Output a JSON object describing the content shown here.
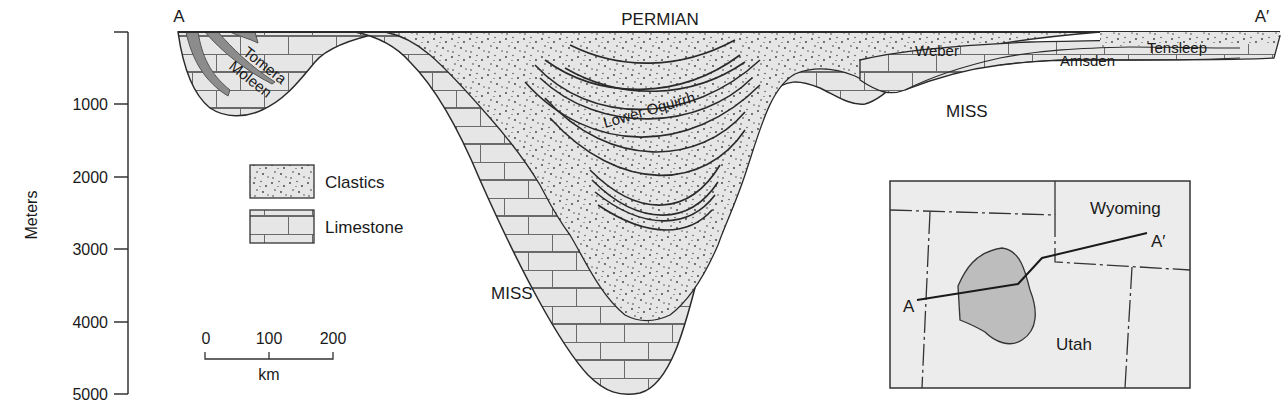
{
  "section_ends": {
    "left": "A",
    "right": "A′"
  },
  "y_axis": {
    "label": "Meters",
    "ticks": [
      {
        "value": "1000",
        "y": 104
      },
      {
        "value": "2000",
        "y": 177
      },
      {
        "value": "3000",
        "y": 249
      },
      {
        "value": "4000",
        "y": 322
      },
      {
        "value": "5000",
        "y": 394
      }
    ]
  },
  "formations": {
    "permian": "PERMIAN",
    "tomera": "Tomera",
    "moleen": "Moleen",
    "lower_oquirrh": "Lower Oquirrh",
    "weber": "Weber",
    "amsden": "Amsden",
    "tensleep": "Tensleep",
    "miss_left": "MISS",
    "miss_right": "MISS"
  },
  "legend": {
    "items": [
      {
        "label": "Clastics",
        "pattern": "dots"
      },
      {
        "label": "Limestone",
        "pattern": "bricks"
      }
    ]
  },
  "scale_bar": {
    "ticks": [
      "0",
      "100",
      "200"
    ],
    "unit": "km"
  },
  "inset_map": {
    "states": [
      "Wyoming",
      "Utah"
    ],
    "line_ends": {
      "start": "A",
      "end": "A′"
    }
  },
  "colors": {
    "fill": "#e6e6e6",
    "line": "#2a2a2a",
    "dot": "#3a3a3a",
    "brick": "#555555",
    "thrust": "#888888",
    "basin_shade": "#bdbdbd"
  }
}
